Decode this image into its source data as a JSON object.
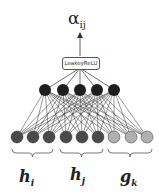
{
  "output": {
    "symbol": "α",
    "subscript": "ij"
  },
  "activation": {
    "label": "LeakeyReLU"
  },
  "hidden_layer": {
    "count": 5,
    "color": "#1e1e1e"
  },
  "input_groups": [
    {
      "label": "h",
      "subscript": "i",
      "color": "#4a4a4a",
      "nodes": 3
    },
    {
      "label": "h",
      "subscript": "j",
      "color": "#4a4a4a",
      "nodes": 3
    },
    {
      "label": "g",
      "subscript": "k",
      "color": "#b0b0b0",
      "nodes": 3
    }
  ]
}
